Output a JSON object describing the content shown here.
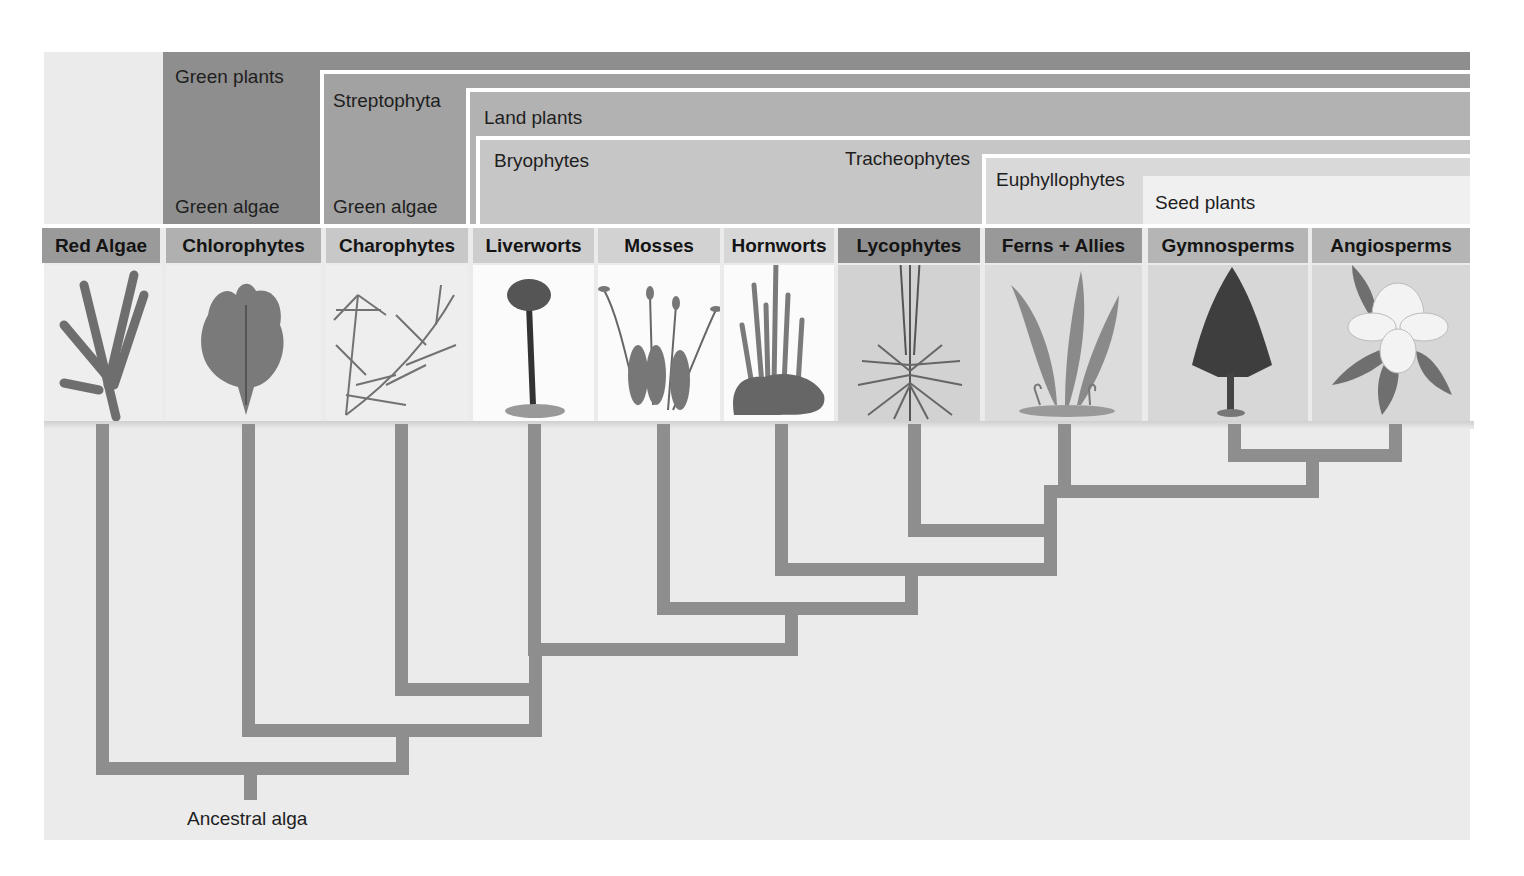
{
  "figure": {
    "root_label": "Ancestral alga",
    "colors": {
      "panel_bg": "#ebebeb",
      "green_plants": "#8e8e8e",
      "streptophyta": "#a2a2a2",
      "land_plants": "#b2b2b2",
      "bryophytes": "#c6c6c6",
      "tracheophytes": "#c6c6c6",
      "euphyllophytes": "#d9d9d9",
      "seed_plants": "#ededed",
      "tree_line": "#8e8e8e"
    }
  },
  "clades": {
    "green_plants": {
      "label": "Green plants",
      "sublabel": "Green algae"
    },
    "streptophyta": {
      "label": "Streptophyta",
      "sublabel": "Green algae"
    },
    "land_plants": {
      "label": "Land plants"
    },
    "bryophytes": {
      "label": "Bryophytes"
    },
    "tracheophytes": {
      "label": "Tracheophytes"
    },
    "euphyllophytes": {
      "label": "Euphyllophytes"
    },
    "seed_plants": {
      "label": "Seed plants"
    }
  },
  "taxa": [
    {
      "name": "Red Algae",
      "illustration": "red-alga-icon"
    },
    {
      "name": "Chlorophytes",
      "illustration": "sea-lettuce-icon"
    },
    {
      "name": "Charophytes",
      "illustration": "stonewort-icon"
    },
    {
      "name": "Liverworts",
      "illustration": "liverwort-icon"
    },
    {
      "name": "Mosses",
      "illustration": "moss-icon"
    },
    {
      "name": "Hornworts",
      "illustration": "hornwort-icon"
    },
    {
      "name": "Lycophytes",
      "illustration": "clubmoss-icon"
    },
    {
      "name": "Ferns + Allies",
      "illustration": "fern-icon"
    },
    {
      "name": "Gymnosperms",
      "illustration": "conifer-tree-icon"
    },
    {
      "name": "Angiosperms",
      "illustration": "magnolia-flower-icon"
    }
  ],
  "tree": {
    "newick": "(Red Algae,(Chlorophytes,(Charophytes,(Liverworts,(Mosses,(Hornworts,(Lycophytes,(Ferns + Allies,(Gymnosperms,Angiosperms))))))))))"
  }
}
